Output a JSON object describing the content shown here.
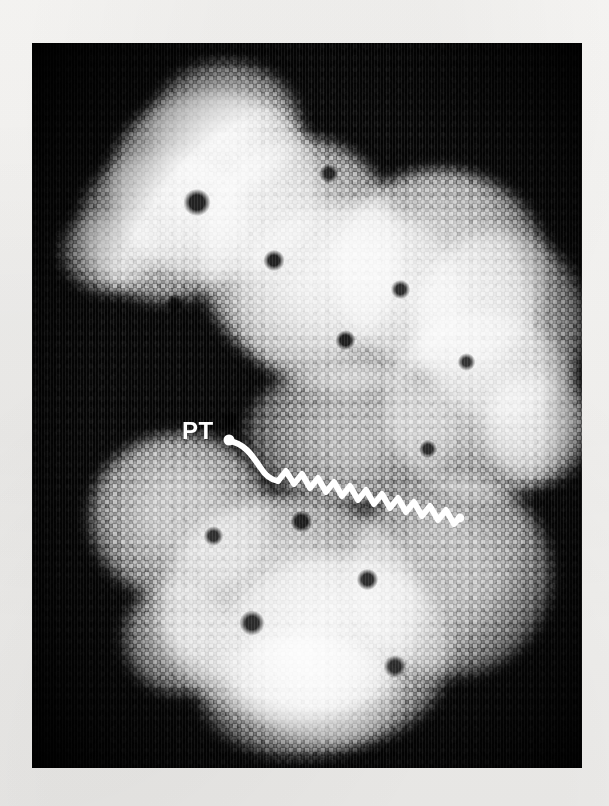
{
  "page": {
    "background_color": "#f6f5f3",
    "width": 609,
    "height": 806
  },
  "figure": {
    "name": "molecular-structure-micrograph",
    "panel": {
      "x": 32,
      "y": 43,
      "width": 550,
      "height": 725,
      "background_color": "#050505"
    },
    "structure_color_light": "#b9b9b9",
    "structure_color_mid": "#8a8a8a",
    "structure_color_dark": "#4a4a4a",
    "background_color": "#000000"
  },
  "annotation": {
    "label": "PT",
    "label_color": "#ffffff",
    "leader": {
      "name": "pt-leader-line",
      "style": "solid-curve-then-zigzag",
      "color": "#ffffff",
      "stroke_width": 6
    },
    "zigzag": {
      "name": "nascent-chain-zigzag",
      "peaks": 13,
      "direction": "down-right",
      "color": "#ffffff"
    }
  }
}
